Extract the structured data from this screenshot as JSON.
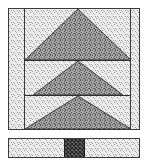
{
  "figure": {
    "title": "Tiered triangle block pattern",
    "description": "Halftone line drawing of a three-tier triangular motif inside a bordered panel, with a separate narrow border strip below containing a dark crosshatched square.",
    "canvas": {
      "width": 155,
      "height": 162,
      "background": "#ffffff"
    }
  },
  "colors": {
    "ink": "#2b2b2b",
    "line": "#3a3a3a",
    "light_fill": "#e9e9e9",
    "light_stipple_dot": "#8d8d8d",
    "dark_fill": "#9e9e9e",
    "dark_stipple_dot": "#4a4a4a",
    "crosshatch_fill": "#6e6e6e",
    "crosshatch_line": "#202020",
    "paper": "#ffffff"
  },
  "main_panel": {
    "label": "main-panel",
    "x": 8,
    "y": 8,
    "width": 132,
    "height": 122,
    "fill": "light-stipple",
    "border_color": "#3a3a3a",
    "border_width": 1
  },
  "side_columns": {
    "label": "side-columns",
    "left_inner_x": 24,
    "right_inner_x": 124,
    "note": "Vertical rules defining narrow left and right border columns"
  },
  "tier_dividers": {
    "label": "tier-dividers",
    "y_values": [
      60,
      95
    ],
    "note": "Horizontal rules splitting the field into three tiers"
  },
  "triangles": [
    {
      "name": "top-triangle",
      "tier": 1,
      "apex": {
        "x": 78,
        "y": 9
      },
      "base_left": {
        "x": 25,
        "y": 60
      },
      "base_right": {
        "x": 131,
        "y": 60
      },
      "base_width": 106,
      "height": 51,
      "fill": "dark-stipple"
    },
    {
      "name": "middle-triangle",
      "tier": 2,
      "apex": {
        "x": 78,
        "y": 61
      },
      "base_left": {
        "x": 33,
        "y": 95
      },
      "base_right": {
        "x": 123,
        "y": 95
      },
      "base_width": 90,
      "height": 34,
      "fill": "dark-stipple"
    },
    {
      "name": "bottom-triangle",
      "tier": 3,
      "apex": {
        "x": 78,
        "y": 96
      },
      "base_left": {
        "x": 25,
        "y": 129
      },
      "base_right": {
        "x": 131,
        "y": 129
      },
      "base_width": 106,
      "height": 33,
      "fill": "dark-stipple"
    }
  ],
  "border_strip": {
    "label": "border-strip",
    "x": 8,
    "y": 138,
    "width": 132,
    "height": 20,
    "fill": "light-stipple",
    "border_color": "#3a3a3a",
    "accent_block": {
      "name": "crosshatch-block",
      "x": 64,
      "y": 139,
      "width": 21,
      "height": 18,
      "fill": "crosshatch",
      "note": "Dark diagonal crosshatched square centered in the strip"
    }
  }
}
